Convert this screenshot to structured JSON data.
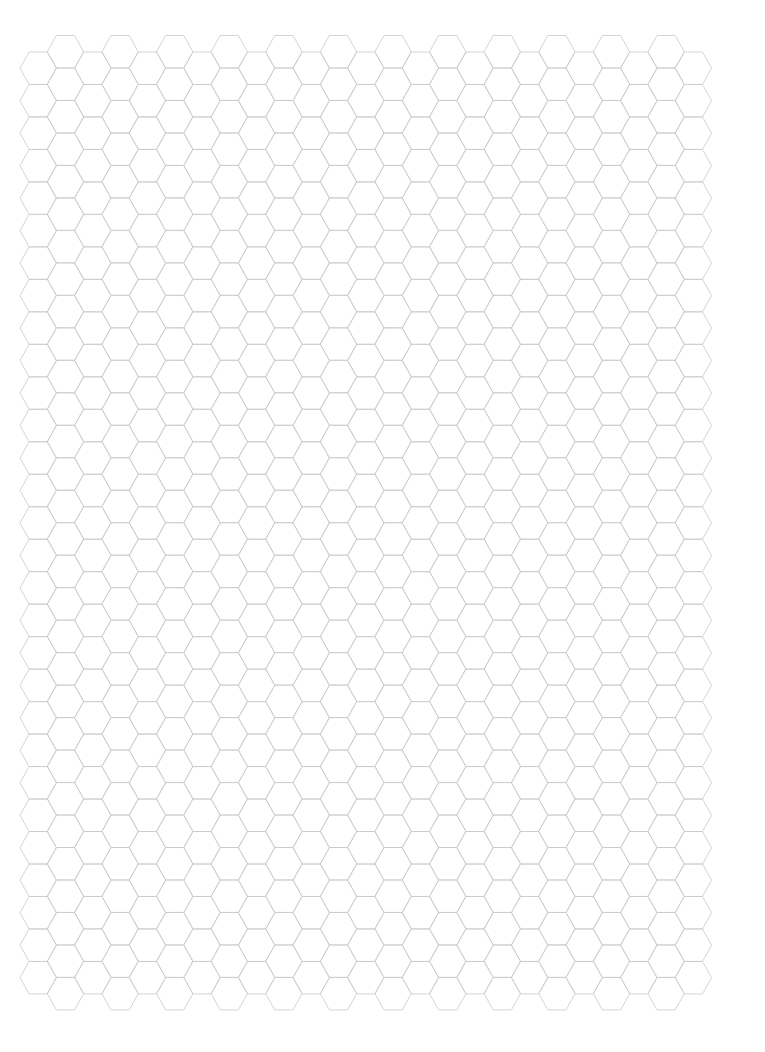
{
  "page": {
    "background": "#ffffff",
    "width": 765,
    "height": 1052
  },
  "grid": {
    "orientation": "flat-top",
    "columns": 25,
    "origin_x": 20,
    "column_pitch": 27.3,
    "side_length_x": 18.2,
    "half_height": 16.24,
    "lower_column_top_y": 52,
    "lower_column_rows": 29,
    "upper_column_top_y": 35.5,
    "upper_column_rows": 30,
    "line_color": "#c9c9c9",
    "line_width": 0.8
  }
}
